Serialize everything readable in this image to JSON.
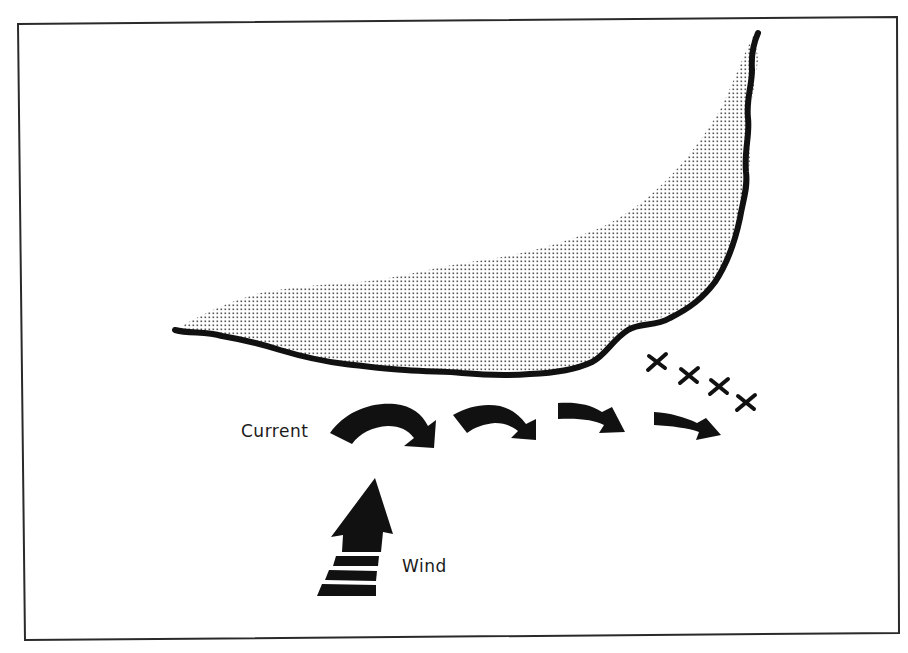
{
  "diagram": {
    "labels": {
      "current": "Current",
      "wind": "Wind"
    },
    "elements": {
      "landmass": "stippled-landmass",
      "coastline": "thick-coastline",
      "current_arrows": 4,
      "x_marks": 4,
      "wind_arrow": "striped-upward-arrow"
    },
    "colors": {
      "ink": "#111111",
      "background": "#ffffff",
      "stipple": "#555555",
      "frame": "#2a2a2a"
    }
  }
}
